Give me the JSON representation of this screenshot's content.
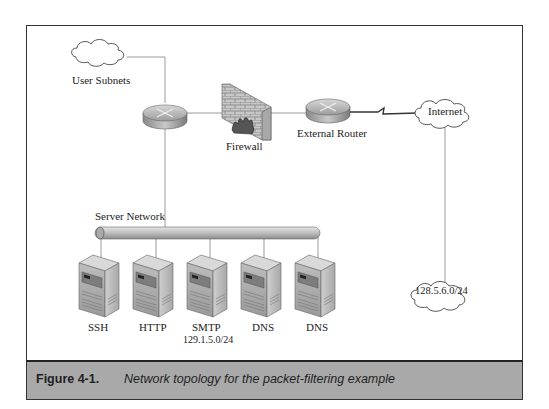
{
  "diagram": {
    "nodes": {
      "user_subnets": {
        "label": "User Subnets",
        "type": "cloud"
      },
      "internal_router": {
        "label": "",
        "type": "router"
      },
      "firewall": {
        "label": "Firewall",
        "type": "firewall"
      },
      "external_router": {
        "label": "External Router",
        "type": "router"
      },
      "internet": {
        "label": "Internet",
        "type": "cloud"
      },
      "remote_network": {
        "label": "128.5.6.0/24",
        "type": "cloud"
      },
      "server_network": {
        "label": "Server Network",
        "type": "bus"
      },
      "servers": [
        {
          "label": "SSH",
          "type": "server"
        },
        {
          "label": "HTTP",
          "type": "server"
        },
        {
          "label": "SMTP",
          "type": "server"
        },
        {
          "label": "DNS",
          "type": "server"
        },
        {
          "label": "DNS",
          "type": "server"
        }
      ],
      "server_subnet": {
        "label": "129.1.5.0/24"
      }
    },
    "edges": [
      [
        "user_subnets",
        "internal_router"
      ],
      [
        "internal_router",
        "firewall"
      ],
      [
        "firewall",
        "external_router"
      ],
      [
        "external_router",
        "internet",
        "serial-link"
      ],
      [
        "internet",
        "remote_network"
      ],
      [
        "internal_router",
        "server_network"
      ],
      [
        "server_network",
        "servers"
      ]
    ]
  },
  "caption": {
    "label": "Figure 4-1.",
    "text": "Network topology for the packet-filtering example"
  },
  "colors": {
    "caption_bg": "#a9a9a9",
    "border": "#333333",
    "line": "#9a9a9a"
  }
}
